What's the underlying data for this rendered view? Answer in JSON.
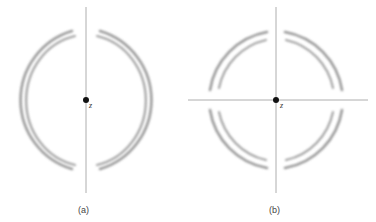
{
  "figure": {
    "panels": [
      {
        "id": "a",
        "caption": "(a)",
        "center_label": "z",
        "axes": [
          "vertical"
        ],
        "description": "Two nested crescent-shaped lobe pairs, left and right of a vertical axis"
      },
      {
        "id": "b",
        "caption": "(b)",
        "center_label": "z",
        "axes": [
          "vertical",
          "horizontal"
        ],
        "description": "Four double-arc lobes in each quadrant around crossed axes"
      }
    ],
    "colors": {
      "axis": "#9a9a9a",
      "arc": "#7a7a7a",
      "dot": "#111111"
    }
  }
}
